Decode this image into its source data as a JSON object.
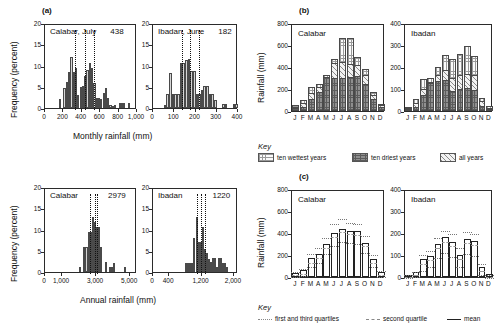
{
  "figure": {
    "panels": [
      "(a)",
      "(b)",
      "(c)"
    ]
  },
  "panel_a": {
    "letter": "(a)",
    "ylabel": "Frequency (percent)",
    "xlabel_monthly": "Monthly rainfall (mm)",
    "xlabel_annual": "Annual rainfall (mm)",
    "charts": [
      {
        "id": "calabar-july",
        "title": "Calabar, July  438",
        "title_place": "Calabar, July",
        "title_value": "438",
        "yticks": [
          "0",
          "5",
          "10",
          "15",
          "20"
        ],
        "xticks": [
          "0",
          "200",
          "400",
          "600",
          "800",
          "1,000"
        ]
      },
      {
        "id": "ibadan-june",
        "title": "Ibadan, June  182",
        "title_place": "Ibadan, June",
        "title_value": "182",
        "yticks": [
          "0",
          "5",
          "10",
          "15",
          "20"
        ],
        "xticks": [
          "0",
          "100",
          "200",
          "300",
          "400"
        ]
      },
      {
        "id": "calabar-annual",
        "title": "Calabar        2979",
        "title_place": "Calabar",
        "title_value": "2979",
        "yticks": [
          "0",
          "5",
          "10",
          "15",
          "20"
        ],
        "xticks": [
          "0",
          "1,000",
          "3,000",
          "5,000"
        ]
      },
      {
        "id": "ibadan-annual",
        "title": "Ibadan        1220",
        "title_place": "Ibadan",
        "title_value": "1220",
        "yticks": [
          "0",
          "5",
          "10",
          "15",
          "20"
        ],
        "xticks": [
          "0",
          "400",
          "1,200",
          "2,000"
        ]
      }
    ]
  },
  "panel_b": {
    "letter": "(b)",
    "ylabel": "Rainfall (mm)",
    "charts": [
      {
        "id": "b-calabar",
        "title": "Calabar",
        "yticks": [
          "0",
          "200",
          "400",
          "600",
          "800"
        ]
      },
      {
        "id": "b-ibadan",
        "title": "Ibadan",
        "yticks": [
          "0",
          "100",
          "200",
          "300",
          "400"
        ]
      }
    ],
    "key_label": "Key",
    "key_items": [
      {
        "label": "ten wettest years",
        "pattern": "grid"
      },
      {
        "label": "ten driest years",
        "pattern": "dark"
      },
      {
        "label": "all years",
        "pattern": "diagonal"
      }
    ]
  },
  "panel_c": {
    "letter": "(c)",
    "ylabel": "Rainfall (mm)",
    "charts": [
      {
        "id": "c-calabar",
        "title": "Calabar",
        "yticks": [
          "0",
          "200",
          "400",
          "600",
          "800"
        ]
      },
      {
        "id": "c-ibadan",
        "title": "Ibadan",
        "yticks": [
          "0",
          "100",
          "200",
          "300",
          "400"
        ]
      }
    ],
    "key_label": "Key",
    "key_items": [
      {
        "label": "first and third quartiles",
        "style": "dotted"
      },
      {
        "label": "second quartile",
        "style": "dashed"
      },
      {
        "label": "mean",
        "style": "solid"
      }
    ]
  },
  "chart_data": [
    {
      "id": "calabar-july",
      "type": "bar",
      "title": "Calabar, July 438",
      "xlabel": "Monthly rainfall (mm)",
      "ylabel": "Frequency (percent)",
      "xlim": [
        0,
        1000
      ],
      "ylim": [
        0,
        20
      ],
      "grid": false,
      "bin_width": 25,
      "bin_starts": [
        150,
        175,
        200,
        225,
        250,
        275,
        300,
        325,
        350,
        375,
        400,
        425,
        450,
        475,
        500,
        525,
        550,
        575,
        600,
        625,
        650,
        675,
        700,
        725,
        750,
        775,
        800,
        825,
        850,
        875,
        900
      ],
      "values": [
        2.2,
        0,
        4.8,
        6.2,
        8.4,
        12.0,
        8.5,
        9.5,
        3.1,
        4.9,
        5.1,
        7.6,
        9.0,
        10.7,
        9.4,
        6.0,
        2.3,
        2.4,
        2.2,
        3.5,
        4.6,
        2.3,
        0.6,
        0.5,
        0.6,
        0.0,
        1.2,
        1.2,
        1.2,
        0.0,
        1.2
      ],
      "annotation_lines": {
        "label": "quartiles (dotted)",
        "x": [
          330,
          430,
          530
        ]
      },
      "mean": 438
    },
    {
      "id": "ibadan-june",
      "type": "bar",
      "title": "Ibadan, June 182",
      "xlabel": "Monthly rainfall (mm)",
      "ylabel": "Frequency (percent)",
      "xlim": [
        0,
        400
      ],
      "ylim": [
        0,
        20
      ],
      "grid": false,
      "bin_width": 12.5,
      "bin_starts": [
        50,
        62.5,
        75,
        87.5,
        100,
        112.5,
        125,
        137.5,
        150,
        162.5,
        175,
        187.5,
        200,
        212.5,
        225,
        237.5,
        250,
        262.5,
        275,
        287.5,
        300,
        312.5,
        325,
        337.5,
        350,
        362.5,
        375,
        387.5
      ],
      "values": [
        0.7,
        3.4,
        8.2,
        3.3,
        3.3,
        3.3,
        10.5,
        10.5,
        11.4,
        11.5,
        8.8,
        8.8,
        3.3,
        3.3,
        4.2,
        5.1,
        5.1,
        3.2,
        3.3,
        2.0,
        0.0,
        0.0,
        0.9,
        0.9,
        0.0,
        0.0,
        0.9,
        0.9
      ],
      "annotation_lines": {
        "label": "quartiles (dotted)",
        "x": [
          135,
          172,
          215
        ]
      },
      "mean": 182
    },
    {
      "id": "calabar-annual",
      "type": "bar",
      "title": "Calabar 2979",
      "xlabel": "Annual rainfall (mm)",
      "ylabel": "Frequency (percent)",
      "xlim": [
        0,
        5400
      ],
      "ylim": [
        0,
        20
      ],
      "grid": false,
      "bin_width": 125,
      "bin_starts": [
        2000,
        2125,
        2250,
        2375,
        2500,
        2625,
        2750,
        2875,
        3000,
        3125,
        3250,
        3375,
        3500,
        3625,
        3750,
        3875,
        4000,
        4125,
        4250,
        4375,
        4500,
        4625,
        4750
      ],
      "values": [
        1.2,
        0.0,
        5.9,
        5.9,
        9.4,
        9.4,
        12.9,
        11.8,
        10.7,
        10.7,
        5.9,
        0.0,
        2.3,
        0.0,
        1.2,
        1.2,
        2.2,
        0.0,
        0.0,
        0.0,
        0.0,
        1.2,
        0.0
      ],
      "annotation_lines": {
        "label": "quartiles (dotted)",
        "x": [
          2650,
          2960,
          3080
        ]
      },
      "mean": 2979
    },
    {
      "id": "ibadan-annual",
      "type": "bar",
      "title": "Ibadan 1220",
      "xlabel": "Annual rainfall (mm)",
      "ylabel": "Frequency (percent)",
      "xlim": [
        0,
        2100
      ],
      "ylim": [
        0,
        20
      ],
      "grid": false,
      "bin_width": 50,
      "bin_starts": [
        800,
        850,
        900,
        950,
        1000,
        1050,
        1100,
        1150,
        1200,
        1250,
        1300,
        1350,
        1400,
        1450,
        1500,
        1550,
        1600,
        1650,
        1700,
        1750,
        1800,
        1850,
        1900,
        1950
      ],
      "values": [
        2.2,
        2.2,
        2.2,
        2.2,
        8.1,
        13.0,
        7.0,
        7.0,
        10.6,
        5.5,
        4.5,
        3.0,
        2.3,
        3.4,
        3.4,
        1.2,
        3.4,
        3.4,
        2.2,
        2.2,
        1.2,
        0.0,
        0.0,
        0.0
      ],
      "annotation_lines": {
        "label": "quartiles (dotted)",
        "x": [
          1090,
          1190,
          1290
        ]
      },
      "mean": 1220
    },
    {
      "id": "b-calabar",
      "type": "bar",
      "title": "Calabar",
      "ylabel": "Rainfall (mm)",
      "categories": [
        "J",
        "F",
        "M",
        "A",
        "M",
        "J",
        "J",
        "A",
        "S",
        "O",
        "N",
        "D"
      ],
      "ylim": [
        0,
        800
      ],
      "grid": false,
      "series": [
        {
          "name": "ten wettest years",
          "values": [
            55,
            100,
            215,
            250,
            330,
            470,
            660,
            660,
            495,
            380,
            175,
            65
          ]
        },
        {
          "name": "all years",
          "values": [
            40,
            75,
            160,
            220,
            300,
            435,
            450,
            430,
            420,
            330,
            150,
            55
          ]
        },
        {
          "name": "ten driest years",
          "values": [
            25,
            40,
            105,
            170,
            305,
            300,
            300,
            310,
            320,
            250,
            110,
            35
          ]
        }
      ]
    },
    {
      "id": "b-ibadan",
      "type": "bar",
      "title": "Ibadan",
      "ylabel": "Rainfall (mm)",
      "categories": [
        "J",
        "F",
        "M",
        "A",
        "M",
        "J",
        "J",
        "A",
        "S",
        "O",
        "N",
        "D"
      ],
      "ylim": [
        0,
        400
      ],
      "grid": false,
      "series": [
        {
          "name": "ten wettest years",
          "values": [
            18,
            55,
            145,
            150,
            200,
            255,
            235,
            260,
            295,
            250,
            60,
            25
          ]
        },
        {
          "name": "all years",
          "values": [
            12,
            35,
            100,
            130,
            165,
            185,
            150,
            165,
            170,
            165,
            45,
            15
          ]
        },
        {
          "name": "ten driest years",
          "values": [
            6,
            18,
            75,
            128,
            138,
            140,
            90,
            100,
            105,
            95,
            22,
            8
          ]
        }
      ]
    },
    {
      "id": "c-calabar",
      "type": "bar",
      "title": "Calabar",
      "ylabel": "Rainfall (mm)",
      "categories": [
        "J",
        "F",
        "M",
        "A",
        "M",
        "J",
        "J",
        "A",
        "S",
        "O",
        "N",
        "D"
      ],
      "ylim": [
        0,
        800
      ],
      "grid": false,
      "series": [
        {
          "name": "mean",
          "values": [
            40,
            60,
            175,
            210,
            300,
            400,
            440,
            415,
            415,
            310,
            165,
            45
          ]
        },
        {
          "name": "second quartile",
          "values": [
            35,
            50,
            150,
            195,
            285,
            385,
            425,
            410,
            400,
            300,
            150,
            35
          ]
        },
        {
          "name": "first quartile",
          "values": [
            18,
            30,
            105,
            150,
            230,
            300,
            335,
            330,
            320,
            235,
            105,
            20
          ]
        },
        {
          "name": "third quartile",
          "values": [
            60,
            90,
            230,
            280,
            375,
            500,
            545,
            505,
            500,
            390,
            215,
            70
          ]
        }
      ]
    },
    {
      "id": "c-ibadan",
      "type": "bar",
      "title": "Ibadan",
      "ylabel": "Rainfall (mm)",
      "categories": [
        "J",
        "F",
        "M",
        "A",
        "M",
        "J",
        "J",
        "A",
        "S",
        "O",
        "N",
        "D"
      ],
      "ylim": [
        0,
        400
      ],
      "grid": false,
      "series": [
        {
          "name": "mean",
          "values": [
            10,
            22,
            80,
            95,
            150,
            180,
            160,
            100,
            175,
            165,
            45,
            12
          ]
        },
        {
          "name": "second quartile",
          "values": [
            8,
            18,
            70,
            88,
            140,
            170,
            150,
            92,
            165,
            155,
            38,
            9
          ]
        },
        {
          "name": "first quartile",
          "values": [
            3,
            8,
            38,
            55,
            95,
            120,
            100,
            55,
            115,
            105,
            18,
            3
          ]
        },
        {
          "name": "third quartile",
          "values": [
            16,
            34,
            108,
            128,
            188,
            218,
            205,
            140,
            215,
            205,
            68,
            20
          ]
        }
      ]
    }
  ]
}
